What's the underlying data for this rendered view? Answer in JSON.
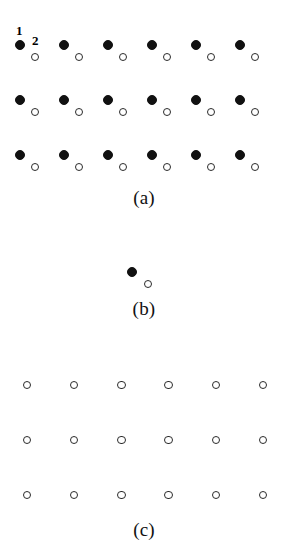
{
  "figure": {
    "background_color": "#ffffff",
    "ink_color": "#111111",
    "marker_legend": {
      "filled_label": "1",
      "open_label": "2",
      "filled_meaning": "sublattice site 1 (filled circle)",
      "open_meaning": "sublattice site 2 (open circle)"
    }
  },
  "panels": [
    {
      "id": "a",
      "caption": "(a)",
      "caption_x": 144,
      "caption_y": 188,
      "description": "Dimerized lattice: 3 rows x 6 columns of site pairs, each pair a filled circle with an open circle offset down and to the right",
      "rows": 3,
      "columns": 6,
      "column_spacing": 44,
      "row_spacing": 55,
      "filled_radius": 5,
      "open_radius": 4,
      "pair_offset_x": 15,
      "pair_offset_y": 12,
      "origin_x": 20,
      "origin_y": 45,
      "labels": [
        {
          "text": "1",
          "x": 16,
          "y": 24
        },
        {
          "text": "2",
          "x": 32,
          "y": 34
        }
      ]
    },
    {
      "id": "b",
      "caption": "(b)",
      "caption_x": 144,
      "caption_y": 299,
      "description": "Single isolated dimer: one filled circle and one open circle offset down and to the right",
      "rows": 1,
      "columns": 1,
      "column_spacing": 44,
      "row_spacing": 55,
      "filled_radius": 5,
      "open_radius": 4,
      "pair_offset_x": 16,
      "pair_offset_y": 12,
      "origin_x": 132,
      "origin_y": 272,
      "labels": []
    },
    {
      "id": "c",
      "caption": "(c)",
      "caption_x": 144,
      "caption_y": 520,
      "description": "Undimerized lattice: 3 rows x 6 columns of open circles only, evenly spaced",
      "rows": 3,
      "columns": 6,
      "column_spacing": 47.2,
      "row_spacing": 55,
      "filled_radius": 0,
      "open_radius": 4.2,
      "pair_offset_x": 0,
      "pair_offset_y": 0,
      "origin_x": 27,
      "origin_y": 385,
      "labels": []
    }
  ]
}
